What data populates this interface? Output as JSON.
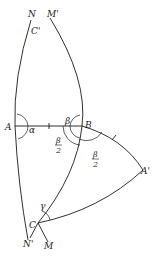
{
  "diagram": {
    "type": "spherical-triangle-construction",
    "points": {
      "N": {
        "label": "N",
        "x": 31,
        "y": 17
      },
      "M_prime": {
        "label": "M'",
        "x": 50,
        "y": 17
      },
      "C_prime": {
        "label": "C'",
        "x": 34,
        "y": 35
      },
      "A": {
        "label": "A",
        "x": 6,
        "y": 130
      },
      "B": {
        "label": "B",
        "x": 85,
        "y": 129
      },
      "A_prime": {
        "label": "A'",
        "x": 141,
        "y": 175
      },
      "C": {
        "label": "C",
        "x": 29,
        "y": 228
      },
      "N_prime": {
        "label": "N'",
        "x": 24,
        "y": 248
      },
      "M": {
        "label": "M",
        "x": 45,
        "y": 249
      }
    },
    "angles": {
      "alpha": "α",
      "beta": "β",
      "gamma": "γ",
      "half_beta_num": "β",
      "half_beta_den": "2"
    },
    "stroke_color": "#1a1a1a",
    "background": "#ffffff"
  }
}
